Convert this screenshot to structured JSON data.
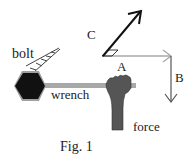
{
  "figure": {
    "caption": "Fig. 1",
    "labels": {
      "bolt": "bolt",
      "wrench": "wrench",
      "force": "force",
      "arrow_a": "A",
      "arrow_b": "B",
      "arrow_c": "C"
    },
    "colors": {
      "bolt": "#111111",
      "bolt_rim": "#9a9a9a",
      "wrench": "#a8a8a8",
      "hand": "#555555",
      "arrow_a": "#a8a8a8",
      "arrow_b": "#555555",
      "arrow_c": "#111111"
    }
  }
}
